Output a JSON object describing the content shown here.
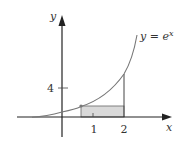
{
  "diagram": {
    "function_label": "y = e",
    "function_label_exponent": "x",
    "y_axis_label": "y",
    "x_axis_label": "x",
    "y_tick_label": "4",
    "x_tick_labels": [
      "1",
      "2"
    ],
    "colors": {
      "axis": "#222222",
      "curve": "#666666",
      "shaded_rect": "#d9d9d9",
      "rect_stroke": "#555555"
    }
  }
}
